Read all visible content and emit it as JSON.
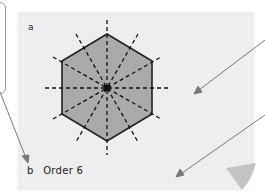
{
  "figure": {
    "part_a_label": "a",
    "part_b_label": "b",
    "part_b_text": "Order 6",
    "shape": "regular-hexagon",
    "lines_of_symmetry": 6,
    "rotational_symmetry_order": 6
  },
  "colors": {
    "paper": "#eeeeee",
    "hexagon_fill": "#aaaaaa",
    "hexagon_stroke": "#222222",
    "symmetry_lines": "#111111",
    "arrows": "#777777",
    "page_curl": "#c4c4c4"
  },
  "annotations": {
    "arrow_count": 3
  }
}
